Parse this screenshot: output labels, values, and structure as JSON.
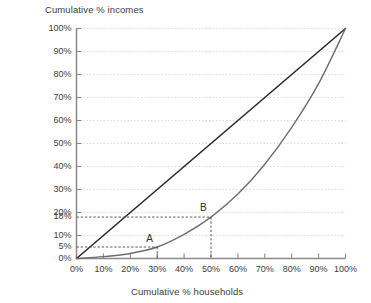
{
  "chart_data": {
    "type": "line",
    "title": "",
    "xlabel": "Cumulative % households",
    "ylabel": "Cumulative % incomes",
    "xlim": [
      0,
      100
    ],
    "ylim": [
      0,
      100
    ],
    "grid": true,
    "grid_style": "dotted",
    "legend": "none",
    "x_ticks": [
      "0%",
      "10%",
      "20%",
      "30%",
      "40%",
      "50%",
      "60%",
      "70%",
      "80%",
      "90%",
      "100%"
    ],
    "x_tick_values": [
      0,
      10,
      20,
      30,
      40,
      50,
      60,
      70,
      80,
      90,
      100
    ],
    "y_ticks": [
      "0%",
      "10%",
      "20%",
      "30%",
      "40%",
      "50%",
      "60%",
      "70%",
      "80%",
      "90%",
      "100%"
    ],
    "y_tick_values": [
      0,
      10,
      20,
      30,
      40,
      50,
      60,
      70,
      80,
      90,
      100
    ],
    "extra_y_labels": [
      {
        "label": "18%",
        "value": 18
      },
      {
        "label": "5%",
        "value": 5
      }
    ],
    "series": [
      {
        "name": "line-of-equality",
        "style": "solid",
        "color": "#2b2b2b",
        "width": 1.6,
        "x": [
          0,
          100
        ],
        "values": [
          0,
          100
        ]
      },
      {
        "name": "lorenz-curve",
        "style": "solid",
        "color": "#6e6e6e",
        "width": 1.4,
        "x": [
          0,
          10,
          20,
          30,
          40,
          50,
          60,
          70,
          80,
          90,
          100
        ],
        "values": [
          0,
          0.8,
          2.2,
          5,
          10.5,
          18,
          28,
          41,
          57,
          76,
          100
        ]
      }
    ],
    "annotations": [
      {
        "label": "A",
        "x": 30,
        "y": 5,
        "guide": "dashed",
        "guide_color": "#4a4a4a"
      },
      {
        "label": "B",
        "x": 50,
        "y": 18,
        "guide": "dashed",
        "guide_color": "#4a4a4a"
      }
    ],
    "colors": {
      "axis": "#8a8a8a",
      "grid": "#c9cdd4",
      "text": "#3c3c3c",
      "equality_line": "#2b2b2b",
      "lorenz_line": "#6e6e6e",
      "guide_line": "#4a4a4a",
      "background": "#ffffff"
    }
  }
}
